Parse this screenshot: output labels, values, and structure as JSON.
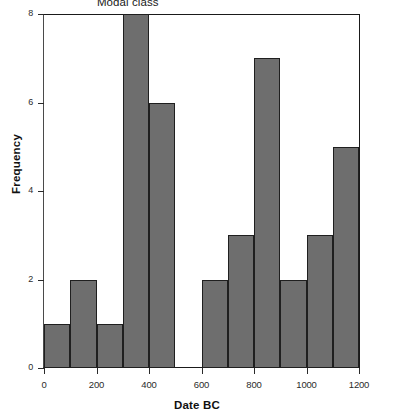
{
  "chart_data": {
    "type": "bar",
    "title": "",
    "subtitle": "",
    "xlabel": "Date BC",
    "ylabel": "Frequency",
    "grid": false,
    "legend": "none",
    "bin_width": 100,
    "xlim": [
      0,
      1200
    ],
    "ylim": [
      0,
      8
    ],
    "xticks": [
      0,
      200,
      400,
      600,
      800,
      1000,
      1200
    ],
    "xtick_labels": [
      "0",
      "200",
      "400",
      "600",
      "800",
      "1000",
      "1200"
    ],
    "yticks": [
      0,
      2,
      4,
      6,
      8
    ],
    "ytick_labels": [
      "0",
      "2",
      "4",
      "6",
      "8"
    ],
    "categories": [
      "0-100",
      "100-200",
      "200-300",
      "300-400",
      "400-500",
      "500-600",
      "600-700",
      "700-800",
      "800-900",
      "900-1000",
      "1000-1100",
      "1100-1200"
    ],
    "bin_starts": [
      0,
      100,
      200,
      300,
      400,
      500,
      600,
      700,
      800,
      900,
      1000,
      1100
    ],
    "values": [
      1,
      2,
      1,
      8,
      6,
      0,
      2,
      3,
      7,
      2,
      3,
      5
    ],
    "annotations": [
      {
        "text": "Modal class",
        "x": 350,
        "y": 8.25
      }
    ],
    "colors": {
      "bar_fill": "#6e6e6e",
      "bar_edge": "#1f1f1f",
      "axis": "#1a1a1a",
      "background": "#ffffff",
      "text": "#1a1a1a"
    }
  }
}
